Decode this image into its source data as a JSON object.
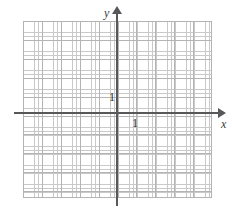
{
  "figure": {
    "type": "coordinate-plane",
    "title": "",
    "background_color": "#ffffff",
    "width": 232,
    "height": 217
  },
  "axes": {
    "x": {
      "label": "x",
      "color": "#58585a",
      "arrow": "arrow-right",
      "tick_label": "1"
    },
    "y": {
      "label": "y",
      "color": "#58585a",
      "arrow": "arrow-up",
      "tick_label": "1"
    },
    "origin": {
      "x": 117,
      "y": 113
    }
  },
  "grid": {
    "major_color": "#b4b4b4",
    "minor_color": "#c9c9c9",
    "major_step_px": 18.9,
    "minor_step_px": 3.8,
    "columns": 10,
    "rows": 9,
    "style": "dotted"
  },
  "chart_data": {
    "type": "scatter",
    "title": "",
    "xlabel": "x",
    "ylabel": "y",
    "xlim": [
      -5,
      5
    ],
    "ylim": [
      -4.5,
      4.5
    ],
    "xticks": [
      1
    ],
    "yticks": [
      1
    ],
    "xticklabels": [
      "1"
    ],
    "yticklabels": [
      "1"
    ],
    "grid": true,
    "legend": null,
    "series": [
      {
        "name": "",
        "x": [],
        "y": []
      }
    ],
    "annotations": []
  }
}
